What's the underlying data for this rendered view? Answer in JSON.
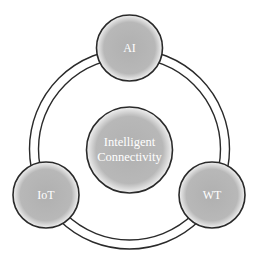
{
  "diagram": {
    "center": {
      "label_line1": "Intelligent",
      "label_line2": "Connectivity"
    },
    "nodes": [
      {
        "id": "ai",
        "label": "AI"
      },
      {
        "id": "iot",
        "label": "IoT"
      },
      {
        "id": "wt",
        "label": "WT"
      }
    ]
  },
  "colors": {
    "fill": "#b4b4b4",
    "stroke": "#2a2a2a",
    "text": "#ffffff",
    "background": "#ffffff"
  }
}
